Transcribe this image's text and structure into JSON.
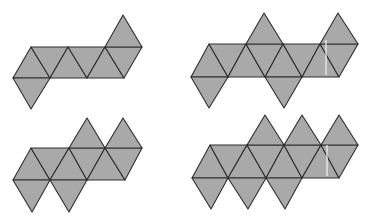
{
  "figure": {
    "fill_color": "#a9a9a9",
    "stroke_color": "#2e2e2e",
    "background_color": "#ffffff"
  },
  "nets": [
    {
      "id": "net-top-left",
      "triangles": [
        [
          [
            13,
            78
          ],
          [
            31,
            47
          ],
          [
            50,
            78
          ]
        ],
        [
          [
            31,
            47
          ],
          [
            50,
            78
          ],
          [
            68,
            47
          ]
        ],
        [
          [
            50,
            78
          ],
          [
            68,
            47
          ],
          [
            87,
            78
          ]
        ],
        [
          [
            68,
            47
          ],
          [
            87,
            78
          ],
          [
            105,
            47
          ]
        ],
        [
          [
            87,
            78
          ],
          [
            105,
            47
          ],
          [
            124,
            78
          ]
        ],
        [
          [
            105,
            47
          ],
          [
            124,
            78
          ],
          [
            142,
            47
          ]
        ],
        [
          [
            105,
            47
          ],
          [
            142,
            47
          ],
          [
            123,
            15
          ]
        ],
        [
          [
            13,
            78
          ],
          [
            50,
            78
          ],
          [
            31,
            109
          ]
        ]
      ]
    },
    {
      "id": "net-top-right",
      "triangles": [
        [
          [
            191,
            77
          ],
          [
            209,
            44
          ],
          [
            228,
            77
          ]
        ],
        [
          [
            209,
            44
          ],
          [
            228,
            77
          ],
          [
            246,
            44
          ]
        ],
        [
          [
            228,
            77
          ],
          [
            246,
            44
          ],
          [
            265,
            77
          ]
        ],
        [
          [
            246,
            44
          ],
          [
            265,
            77
          ],
          [
            283,
            44
          ]
        ],
        [
          [
            265,
            77
          ],
          [
            283,
            44
          ],
          [
            302,
            77
          ]
        ],
        [
          [
            283,
            44
          ],
          [
            302,
            77
          ],
          [
            320,
            44
          ]
        ],
        [
          [
            302,
            77
          ],
          [
            320,
            44
          ],
          [
            339,
            77
          ]
        ],
        [
          [
            320,
            44
          ],
          [
            339,
            77
          ],
          [
            358,
            44
          ]
        ],
        [
          [
            246,
            44
          ],
          [
            283,
            44
          ],
          [
            264,
            13
          ]
        ],
        [
          [
            320,
            44
          ],
          [
            358,
            44
          ],
          [
            338,
            13
          ]
        ],
        [
          [
            191,
            77
          ],
          [
            228,
            77
          ],
          [
            209,
            108
          ]
        ],
        [
          [
            265,
            77
          ],
          [
            302,
            77
          ],
          [
            284,
            108
          ]
        ]
      ]
    },
    {
      "id": "net-bottom-left",
      "triangles": [
        [
          [
            13,
            180
          ],
          [
            31,
            148
          ],
          [
            50,
            180
          ]
        ],
        [
          [
            31,
            148
          ],
          [
            50,
            180
          ],
          [
            69,
            148
          ]
        ],
        [
          [
            50,
            180
          ],
          [
            69,
            148
          ],
          [
            87,
            180
          ]
        ],
        [
          [
            69,
            148
          ],
          [
            87,
            180
          ],
          [
            105,
            148
          ]
        ],
        [
          [
            87,
            180
          ],
          [
            105,
            148
          ],
          [
            125,
            180
          ]
        ],
        [
          [
            105,
            148
          ],
          [
            125,
            180
          ],
          [
            142,
            148
          ]
        ],
        [
          [
            69,
            148
          ],
          [
            105,
            148
          ],
          [
            87,
            118
          ]
        ],
        [
          [
            105,
            148
          ],
          [
            142,
            148
          ],
          [
            123,
            118
          ]
        ],
        [
          [
            13,
            180
          ],
          [
            50,
            180
          ],
          [
            32,
            212
          ]
        ],
        [
          [
            50,
            180
          ],
          [
            87,
            180
          ],
          [
            69,
            212
          ]
        ]
      ]
    },
    {
      "id": "net-bottom-right",
      "triangles": [
        [
          [
            192,
            178
          ],
          [
            210,
            145
          ],
          [
            228,
            178
          ]
        ],
        [
          [
            210,
            145
          ],
          [
            228,
            178
          ],
          [
            247,
            145
          ]
        ],
        [
          [
            228,
            178
          ],
          [
            247,
            145
          ],
          [
            266,
            178
          ]
        ],
        [
          [
            247,
            145
          ],
          [
            266,
            178
          ],
          [
            284,
            145
          ]
        ],
        [
          [
            266,
            178
          ],
          [
            284,
            145
          ],
          [
            302,
            178
          ]
        ],
        [
          [
            284,
            145
          ],
          [
            302,
            178
          ],
          [
            321,
            145
          ]
        ],
        [
          [
            302,
            178
          ],
          [
            321,
            145
          ],
          [
            339,
            178
          ]
        ],
        [
          [
            321,
            145
          ],
          [
            339,
            178
          ],
          [
            358,
            145
          ]
        ],
        [
          [
            247,
            145
          ],
          [
            284,
            145
          ],
          [
            265,
            115
          ]
        ],
        [
          [
            284,
            145
          ],
          [
            321,
            145
          ],
          [
            302,
            115
          ]
        ],
        [
          [
            321,
            145
          ],
          [
            358,
            145
          ],
          [
            339,
            115
          ]
        ],
        [
          [
            192,
            178
          ],
          [
            228,
            178
          ],
          [
            211,
            209
          ]
        ],
        [
          [
            228,
            178
          ],
          [
            266,
            178
          ],
          [
            248,
            209
          ]
        ],
        [
          [
            266,
            178
          ],
          [
            302,
            178
          ],
          [
            285,
            209
          ]
        ]
      ]
    }
  ],
  "artifacts": [
    {
      "x": 326,
      "y1": 40,
      "y2": 75
    },
    {
      "x": 327,
      "y1": 145,
      "y2": 176
    }
  ]
}
